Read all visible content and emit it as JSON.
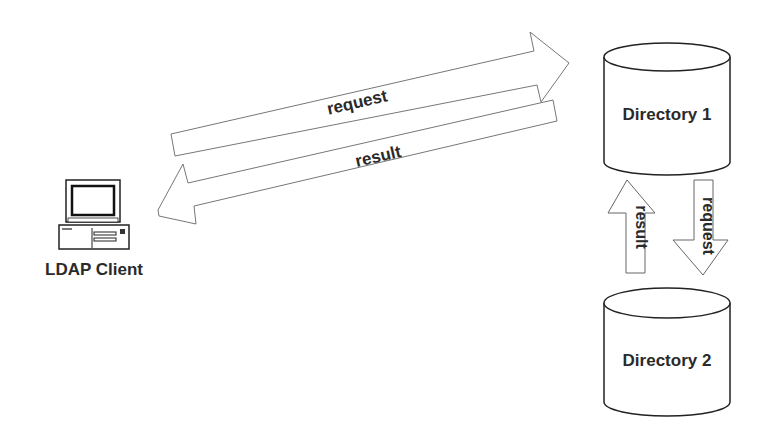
{
  "diagram": {
    "client": {
      "label": "LDAP Client",
      "icon": "desktop-computer-icon"
    },
    "directories": [
      {
        "label": "Directory 1"
      },
      {
        "label": "Directory 2"
      }
    ],
    "arrows": {
      "client_to_dir1": {
        "label": "request",
        "direction": "right"
      },
      "dir1_to_client": {
        "label": "result",
        "direction": "left"
      },
      "dir2_to_dir1": {
        "label": "result",
        "direction": "up"
      },
      "dir1_to_dir2": {
        "label": "request",
        "direction": "down"
      }
    },
    "colors": {
      "stroke": "#555555",
      "text": "#2a2a2a",
      "background": "#ffffff"
    }
  }
}
